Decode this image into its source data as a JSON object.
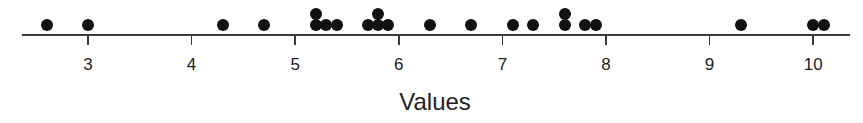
{
  "chart_data": {
    "type": "scatter",
    "subtype": "dot_plot",
    "title": "",
    "xlabel": "Values",
    "ylabel": "",
    "xlim": [
      2.35,
      10.35
    ],
    "xticks": [
      3,
      4,
      5,
      6,
      7,
      8,
      9,
      10
    ],
    "tick_labels": [
      "3",
      "4",
      "5",
      "6",
      "7",
      "8",
      "9",
      "10"
    ],
    "grid": false,
    "legend": null,
    "values": [
      2.6,
      3.0,
      4.3,
      4.7,
      5.2,
      5.2,
      5.3,
      5.4,
      5.7,
      5.8,
      5.8,
      5.9,
      6.3,
      6.7,
      7.1,
      7.3,
      7.6,
      7.6,
      7.8,
      7.9,
      9.3,
      10.0,
      10.1
    ],
    "dot_color": "#111111",
    "axis_color": "#3a3a3a"
  },
  "layout": {
    "axis_y": 35,
    "axis_x_start": 22,
    "axis_x_end": 850,
    "px_origin_value": 3,
    "px_origin_x": 88,
    "px_per_unit": 103.6,
    "dot_base_y": 25,
    "dot_stack_step": 11,
    "dot_stack_tolerance": 0.05
  }
}
